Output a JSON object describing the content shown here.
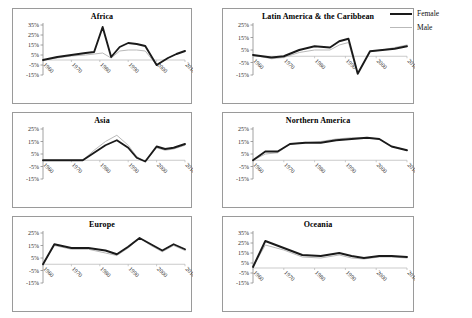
{
  "legend": {
    "items": [
      {
        "label": "Female",
        "color": "#1a1a1a",
        "style": "thick"
      },
      {
        "label": "Male",
        "color": "#b9b9b9",
        "style": "thin"
      }
    ]
  },
  "chart_data": {
    "type": "line",
    "title": "",
    "xlabel": "",
    "ylabel": "",
    "grid": false,
    "legend_position": "top-right",
    "x": [
      1960,
      1970,
      1980,
      1990,
      2000,
      2010
    ],
    "xtick_labels": [
      "1960",
      "1970",
      "1980",
      "1990",
      "2000",
      "2010"
    ],
    "panels": [
      {
        "title": "Africa",
        "ylim": [
          -15,
          35
        ],
        "ytick_labels": [
          "35%",
          "25%",
          "15%",
          "5%",
          "-5%",
          "-15%"
        ],
        "yticks": [
          35,
          25,
          15,
          5,
          -5,
          -15
        ],
        "series": [
          {
            "name": "Female",
            "x": [
              1960,
              1965,
              1970,
              1975,
              1978,
              1981,
              1984,
              1987,
              1990,
              1993,
              1996,
              2000,
              2004,
              2007,
              2010
            ],
            "values": [
              0,
              3,
              5,
              7,
              8,
              33,
              3,
              13,
              17,
              16,
              14,
              -5,
              2,
              6,
              9
            ]
          },
          {
            "name": "Male",
            "x": [
              1960,
              1965,
              1970,
              1975,
              1978,
              1981,
              1984,
              1987,
              1990,
              1993,
              1996,
              2000,
              2004,
              2007,
              2010
            ],
            "values": [
              0,
              2,
              4,
              5,
              6,
              7,
              2,
              9,
              10,
              10,
              9,
              -5,
              2,
              6,
              9
            ]
          }
        ]
      },
      {
        "title": "Latin America & the Caribbean",
        "ylim": [
          -15,
          25
        ],
        "ytick_labels": [
          "25%",
          "15%",
          "5%",
          "-5%",
          "-15%"
        ],
        "yticks": [
          25,
          15,
          5,
          -5,
          -15
        ],
        "series": [
          {
            "name": "Female",
            "x": [
              1960,
              1966,
              1970,
              1975,
              1980,
              1985,
              1988,
              1991,
              1994,
              1998,
              2002,
              2006,
              2010
            ],
            "values": [
              1,
              -1,
              0,
              5,
              8,
              7,
              12,
              14,
              -14,
              4,
              5,
              6,
              8
            ]
          },
          {
            "name": "Male",
            "x": [
              1960,
              1966,
              1970,
              1975,
              1980,
              1985,
              1988,
              1991,
              1994,
              1998,
              2002,
              2006,
              2010
            ],
            "values": [
              1,
              -2,
              -1,
              3,
              5,
              5,
              9,
              11,
              -14,
              4,
              5,
              7,
              9
            ]
          }
        ]
      },
      {
        "title": "Asia",
        "ylim": [
          -15,
          25
        ],
        "ytick_labels": [
          "25%",
          "15%",
          "5%",
          "-5%",
          "-15%"
        ],
        "yticks": [
          25,
          15,
          5,
          -5,
          -15
        ],
        "series": [
          {
            "name": "Female",
            "x": [
              1960,
              1968,
              1974,
              1978,
              1982,
              1986,
              1990,
              1993,
              1996,
              2000,
              2003,
              2006,
              2010
            ],
            "values": [
              0,
              0,
              0,
              6,
              12,
              16,
              10,
              2,
              -1,
              11,
              9,
              10,
              13
            ]
          },
          {
            "name": "Male",
            "x": [
              1960,
              1968,
              1974,
              1978,
              1982,
              1986,
              1990,
              1993,
              1996,
              2000,
              2003,
              2006,
              2010
            ],
            "values": [
              0,
              0,
              0,
              8,
              15,
              20,
              12,
              3,
              -1,
              10,
              8,
              9,
              12
            ]
          }
        ]
      },
      {
        "title": "Northern America",
        "ylim": [
          -15,
          25
        ],
        "ytick_labels": [
          "25%",
          "15%",
          "5%",
          "-5%",
          "-15%"
        ],
        "yticks": [
          25,
          15,
          5,
          -5,
          -15
        ],
        "series": [
          {
            "name": "Female",
            "x": [
              1960,
              1964,
              1968,
              1972,
              1977,
              1982,
              1987,
              1992,
              1997,
              2001,
              2005,
              2010
            ],
            "values": [
              0,
              7,
              7,
              13,
              14,
              14,
              16,
              17,
              18,
              17,
              11,
              8
            ]
          },
          {
            "name": "Male",
            "x": [
              1960,
              1964,
              1968,
              1972,
              1977,
              1982,
              1987,
              1992,
              1997,
              2001,
              2005,
              2010
            ],
            "values": [
              0,
              5,
              6,
              13,
              14,
              15,
              17,
              18,
              18,
              17,
              11,
              8
            ]
          }
        ]
      },
      {
        "title": "Europe",
        "ylim": [
          -15,
          25
        ],
        "ytick_labels": [
          "25%",
          "15%",
          "5%",
          "-5%",
          "-15%"
        ],
        "yticks": [
          25,
          15,
          5,
          -5,
          -15
        ],
        "series": [
          {
            "name": "Female",
            "x": [
              1960,
              1964,
              1970,
              1976,
              1982,
              1986,
              1990,
              1994,
              1998,
              2002,
              2006,
              2010
            ],
            "values": [
              0,
              16,
              13,
              13,
              11,
              8,
              14,
              21,
              16,
              11,
              16,
              12
            ]
          },
          {
            "name": "Male",
            "x": [
              1960,
              1964,
              1970,
              1976,
              1982,
              1986,
              1990,
              1994,
              1998,
              2002,
              2006,
              2010
            ],
            "values": [
              0,
              15,
              12,
              12,
              9,
              7,
              13,
              21,
              15,
              10,
              15,
              11
            ]
          }
        ]
      },
      {
        "title": "Oceania",
        "ylim": [
          -15,
          35
        ],
        "ytick_labels": [
          "35%",
          "25%",
          "15%",
          "5%",
          "-5%",
          "-15%"
        ],
        "yticks": [
          35,
          25,
          15,
          5,
          -5,
          -15
        ],
        "series": [
          {
            "name": "Female",
            "x": [
              1960,
              1964,
              1970,
              1976,
              1982,
              1988,
              1992,
              1996,
              2001,
              2005,
              2010
            ],
            "values": [
              1,
              27,
              20,
              13,
              12,
              15,
              12,
              10,
              12,
              12,
              11
            ]
          },
          {
            "name": "Male",
            "x": [
              1960,
              1964,
              1970,
              1976,
              1982,
              1988,
              1992,
              1996,
              2001,
              2005,
              2010
            ],
            "values": [
              1,
              23,
              18,
              11,
              10,
              13,
              10,
              9,
              11,
              11,
              10
            ]
          }
        ]
      }
    ]
  }
}
